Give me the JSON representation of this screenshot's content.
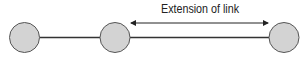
{
  "diagram": {
    "annotation_label": "Extension of link",
    "colors": {
      "node_fill": "#d3d3d3",
      "node_stroke": "#555555",
      "line": "#333333",
      "text": "#222222"
    },
    "nodes": [
      {
        "id": "node-1",
        "cx": 24.5,
        "cy": 37.5,
        "r": 15
      },
      {
        "id": "node-2",
        "cx": 115,
        "cy": 37.5,
        "r": 15
      },
      {
        "id": "node-3",
        "cx": 284,
        "cy": 37.5,
        "r": 15
      }
    ],
    "links": [
      {
        "from": "node-1",
        "to": "node-2"
      },
      {
        "from": "node-2",
        "to": "node-3"
      }
    ],
    "arrow": {
      "x1": 131,
      "x2": 268,
      "y": 23,
      "bidirectional": true
    }
  }
}
